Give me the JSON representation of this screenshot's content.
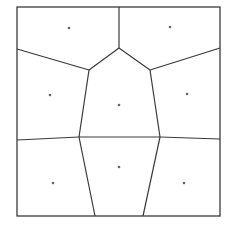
{
  "diagram": {
    "type": "voronoi",
    "colors": {
      "background": "#ffffff",
      "edge": "#3a3a3a",
      "site": "#666666"
    },
    "bounds": {
      "x1": 17,
      "y1": 7,
      "x2": 220,
      "y2": 216
    },
    "sites": [
      {
        "x": 69,
        "y": 28
      },
      {
        "x": 170,
        "y": 27
      },
      {
        "x": 50,
        "y": 95
      },
      {
        "x": 119,
        "y": 105
      },
      {
        "x": 187,
        "y": 94
      },
      {
        "x": 53,
        "y": 183
      },
      {
        "x": 119,
        "y": 167
      },
      {
        "x": 184,
        "y": 183
      }
    ],
    "edges": [
      [
        119,
        7,
        119,
        48
      ],
      [
        119,
        48,
        89,
        70
      ],
      [
        119,
        48,
        150,
        70
      ],
      [
        17,
        49,
        89,
        70
      ],
      [
        150,
        70,
        220,
        48
      ],
      [
        89,
        70,
        79,
        137
      ],
      [
        150,
        70,
        160,
        137
      ],
      [
        17,
        140,
        79,
        137
      ],
      [
        79,
        137,
        160,
        137
      ],
      [
        160,
        137,
        220,
        139
      ],
      [
        79,
        137,
        95,
        216
      ],
      [
        160,
        137,
        143,
        216
      ]
    ]
  }
}
